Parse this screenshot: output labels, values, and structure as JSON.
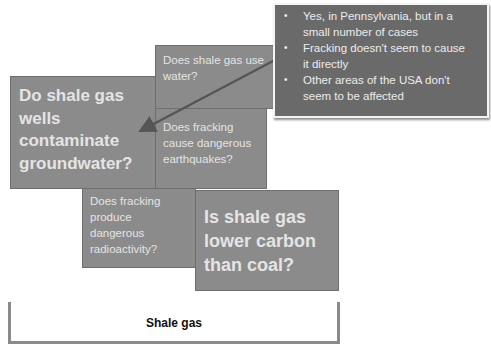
{
  "boxes": {
    "water": {
      "text": "Does shale gas use water?"
    },
    "groundwater": {
      "lines": [
        "Do shale gas",
        "wells",
        "contaminate",
        "groundwater?"
      ]
    },
    "earthquakes": {
      "lines": [
        "Does fracking",
        "cause dangerous",
        "earthquakes?"
      ]
    },
    "radioactivity": {
      "lines": [
        "Does fracking",
        "produce",
        "dangerous",
        "radioactivity?"
      ]
    },
    "carbon": {
      "lines": [
        "Is shale gas",
        "lower carbon",
        "than coal?"
      ]
    }
  },
  "water_lines": [
    "Does shale gas use",
    "water?"
  ],
  "callout": {
    "bullet_glyph": "•",
    "items": [
      {
        "lines": [
          "Yes, in Pennsylvania, but in a",
          "small number of cases"
        ]
      },
      {
        "lines": [
          "Fracking doesn't seem to cause",
          "it directly"
        ]
      },
      {
        "lines": [
          "Other areas of the USA don't",
          "seem to be affected"
        ]
      }
    ]
  },
  "arrow": {
    "from": [
      275,
      60
    ],
    "to": [
      143,
      130
    ],
    "color": "#555555"
  },
  "bracket": {
    "label": "Shale gas"
  },
  "colors": {
    "box_fill": "#8b8b8b",
    "callout_fill": "#6a6a6a",
    "box_text": "#e4e4e4",
    "bracket": "#8a8a8a"
  }
}
